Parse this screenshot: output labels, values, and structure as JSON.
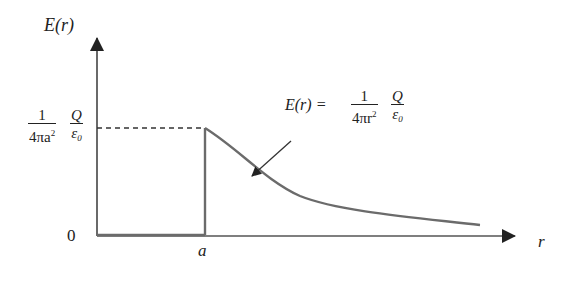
{
  "diagram": {
    "y_axis_label": "E(r)",
    "x_axis_label": "r",
    "origin_label": "0",
    "x_tick_label": "a",
    "y_tick": {
      "numerator": "1",
      "denominator_prefix": "4πa",
      "denominator_exp": "2",
      "numerator2": "Q",
      "denominator2": "ε",
      "denominator2_sub": "0"
    },
    "formula": {
      "lhs": "E(r) =",
      "numerator": "1",
      "denominator_prefix": "4πr",
      "denominator_exp": "2",
      "numerator2": "Q",
      "denominator2": "ε",
      "denominator2_sub": "0"
    },
    "regions": [
      {
        "range": "0 < r < a",
        "value": "0"
      },
      {
        "range": "r ≥ a",
        "value": "Q / (4π ε0 r²)"
      }
    ],
    "colors": {
      "axis": "#333333",
      "curve": "#6b6b6b",
      "text": "#222222"
    }
  }
}
